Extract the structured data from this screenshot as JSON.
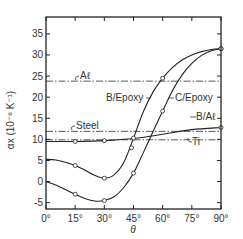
{
  "chart_data": {
    "type": "line",
    "title": "",
    "xlabel": "θ",
    "ylabel": "αx (10⁻⁶ K⁻¹)",
    "xlim": [
      0,
      90
    ],
    "ylim": [
      -6.5,
      39
    ],
    "x_ticks": [
      0,
      15,
      30,
      45,
      60,
      75,
      90
    ],
    "x_tick_labels": [
      "0°",
      "15°",
      "30°",
      "45°",
      "60°",
      "75°",
      "90°"
    ],
    "y_ticks": [
      -5,
      0,
      5,
      10,
      15,
      20,
      25,
      30,
      35
    ],
    "y_tick_labels": [
      "-5",
      "0",
      "5",
      "10",
      "15",
      "20",
      "25",
      "30",
      "35"
    ],
    "grid": false,
    "series": [
      {
        "name": "B/Epoxy",
        "style": "solid-markers",
        "x": [
          0,
          5,
          10,
          15,
          20,
          25,
          30,
          35,
          40,
          45,
          50,
          55,
          60,
          65,
          70,
          75,
          80,
          85,
          90
        ],
        "y": [
          5.3,
          5.1,
          4.6,
          3.8,
          2.7,
          1.5,
          0.8,
          1.6,
          4.5,
          10.3,
          16.5,
          21.2,
          24.5,
          27.0,
          28.8,
          30.0,
          30.8,
          31.3,
          31.5
        ],
        "markers_x": [
          15,
          30,
          45,
          60,
          90
        ],
        "markers_y": [
          3.8,
          0.8,
          10.3,
          24.5,
          31.5
        ]
      },
      {
        "name": "C/Epoxy",
        "style": "solid-markers",
        "x": [
          0,
          5,
          10,
          15,
          20,
          25,
          30,
          35,
          40,
          45,
          50,
          55,
          60,
          65,
          70,
          75,
          80,
          85,
          90
        ],
        "y": [
          0,
          -0.8,
          -1.9,
          -3.0,
          -4.0,
          -4.6,
          -4.5,
          -3.6,
          -1.4,
          2.0,
          6.8,
          11.8,
          16.7,
          21.5,
          25.3,
          28.0,
          29.9,
          31.0,
          31.5
        ],
        "markers_x": [
          15,
          30,
          45,
          60,
          90
        ],
        "markers_y": [
          -3.0,
          -4.5,
          2.0,
          16.7,
          31.5
        ]
      },
      {
        "name": "B/Aℓ",
        "style": "solid-markers",
        "x": [
          0,
          15,
          30,
          45,
          60,
          75,
          90
        ],
        "y": [
          9.5,
          9.5,
          9.7,
          10.2,
          11.2,
          12.3,
          12.8
        ],
        "markers_x": [
          15,
          30,
          44,
          90
        ],
        "markers_y": [
          9.5,
          9.7,
          8.0,
          12.8
        ]
      },
      {
        "name": "Aℓ",
        "style": "dash-dot",
        "x": [
          0,
          90
        ],
        "y": [
          23.8,
          23.8
        ]
      },
      {
        "name": "Steel",
        "style": "dash-dot",
        "x": [
          0,
          90
        ],
        "y": [
          11.9,
          11.9
        ]
      },
      {
        "name": "Ti",
        "style": "dash-dot",
        "x": [
          0,
          90
        ],
        "y": [
          9.9,
          9.9
        ]
      }
    ],
    "annotations": [
      {
        "text": "Aℓ",
        "target": "Aℓ"
      },
      {
        "text": "Steel",
        "target": "Steel"
      },
      {
        "text": "B/Epoxy",
        "target": "B/Epoxy"
      },
      {
        "text": "C/Epoxy",
        "target": "C/Epoxy"
      },
      {
        "text": "B/Aℓ",
        "target": "B/Aℓ"
      },
      {
        "text": "Ti",
        "target": "Ti"
      }
    ]
  }
}
